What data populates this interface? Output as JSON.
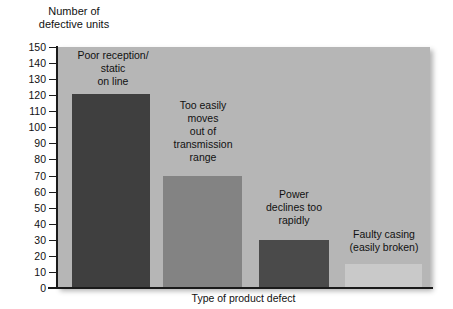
{
  "chart_data": {
    "type": "bar",
    "title": "",
    "subtitle": "",
    "xlabel": "Type of product defect",
    "ylabel": "Number of\ndefective units",
    "categories": [
      "Poor reception/\nstatic\non line",
      "Too easily\nmoves\nout of\ntransmission\nrange",
      "Power\ndeclines too\nrapidly",
      "Faulty casing\n(easily broken)"
    ],
    "values": [
      121,
      70,
      30,
      15
    ],
    "ylim": [
      0,
      150
    ],
    "ytick_step": 10,
    "ytick_labels": [
      "150",
      "140",
      "130",
      "120",
      "110",
      "100",
      "90",
      "80",
      "70",
      "60",
      "50",
      "40",
      "30",
      "20",
      "10",
      "0"
    ],
    "grid": false,
    "legend": "none",
    "bar_colors": [
      "#3f3f3f",
      "#838383",
      "#4a4a4a",
      "#c9c9c9"
    ],
    "plot_background": "#b6b6b6",
    "page_background": "#ffffff",
    "axis_color": "#1a1a1a"
  },
  "axes": {
    "y_title": "Number of\ndefective units",
    "x_title": "Type of product defect"
  },
  "bars": [
    {
      "label": "Poor reception/\nstatic\non line",
      "value": 121,
      "color": "#3f3f3f"
    },
    {
      "label": "Too easily\nmoves\nout of\ntransmission\nrange",
      "value": 70,
      "color": "#838383"
    },
    {
      "label": "Power\ndeclines too\nrapidly",
      "value": 30,
      "color": "#4a4a4a"
    },
    {
      "label": "Faulty casing\n(easily broken)",
      "value": 15,
      "color": "#c9c9c9"
    }
  ],
  "y_ticks": [
    "150",
    "140",
    "130",
    "120",
    "110",
    "100",
    "90",
    "80",
    "70",
    "60",
    "50",
    "40",
    "30",
    "20",
    "10",
    "0"
  ]
}
